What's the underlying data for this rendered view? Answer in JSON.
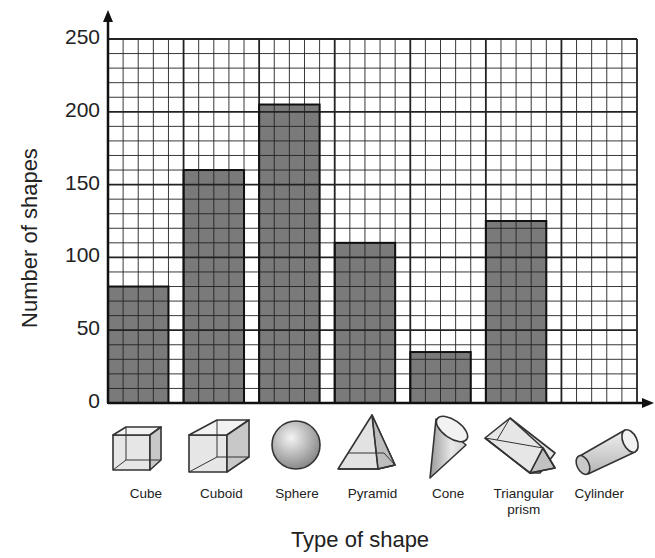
{
  "chart_data": {
    "type": "bar",
    "title": "",
    "xlabel": "Type of shape",
    "ylabel": "Number of shapes",
    "categories": [
      "Cube",
      "Cuboid",
      "Sphere",
      "Pyramid",
      "Cone",
      "Triangular prism",
      "Cylinder"
    ],
    "values": [
      80,
      160,
      205,
      110,
      35,
      125,
      0
    ],
    "ylim": [
      0,
      250
    ],
    "yticks": [
      0,
      50,
      100,
      150,
      200,
      250
    ],
    "grid": true,
    "minor_grid_step": 10,
    "legend": null,
    "bar_color": "#7a7a7a"
  },
  "labels": {
    "xlabel": "Type of shape",
    "ylabel": "Number of shapes",
    "yticks": [
      "0",
      "50",
      "100",
      "150",
      "200",
      "250"
    ],
    "categories": [
      {
        "line1": "Cube",
        "line2": "",
        "icon": "cube-icon"
      },
      {
        "line1": "Cuboid",
        "line2": "",
        "icon": "cuboid-icon"
      },
      {
        "line1": "Sphere",
        "line2": "",
        "icon": "sphere-icon"
      },
      {
        "line1": "Pyramid",
        "line2": "",
        "icon": "pyramid-icon"
      },
      {
        "line1": "Cone",
        "line2": "",
        "icon": "cone-icon"
      },
      {
        "line1": "Triangular",
        "line2": "prism",
        "icon": "triangular-prism-icon"
      },
      {
        "line1": "Cylinder",
        "line2": "",
        "icon": "cylinder-icon"
      }
    ]
  }
}
